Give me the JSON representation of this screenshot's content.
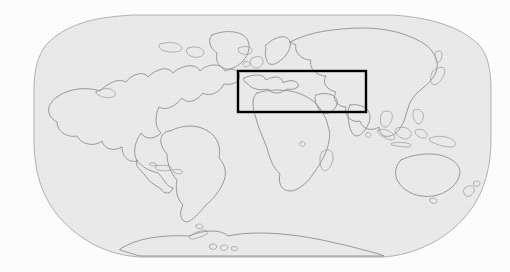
{
  "figure": {
    "kind": "world-map",
    "projection": "Robinson",
    "canvas": {
      "width": 510,
      "height": 272
    },
    "background_color": "#ffffff"
  },
  "map": {
    "ocean_fill_color": "#ececec",
    "ocean_border_color": "#b4b4b4",
    "coastline_color": "#8c8c8c",
    "bounds_px": {
      "left": 35,
      "top": 15,
      "right": 490,
      "bottom": 257
    },
    "graticule": "none",
    "labels": [],
    "tick_labels": []
  },
  "region_of_interest": {
    "name": "mediterranean-middle-east-study-area",
    "outline_color": "#000000",
    "outline_width_px": 2,
    "fill": "none",
    "box_px": {
      "x": 238,
      "y": 71,
      "width": 128,
      "height": 41
    },
    "label": ""
  },
  "landmasses": [
    {
      "name": "north-america"
    },
    {
      "name": "greenland"
    },
    {
      "name": "south-america"
    },
    {
      "name": "africa"
    },
    {
      "name": "europe"
    },
    {
      "name": "asia"
    },
    {
      "name": "australia"
    },
    {
      "name": "new-zealand"
    },
    {
      "name": "antarctica"
    },
    {
      "name": "madagascar"
    },
    {
      "name": "japan"
    },
    {
      "name": "british-isles"
    },
    {
      "name": "indonesia-philippines"
    }
  ],
  "chart_data": {
    "type": "map",
    "title": "",
    "xlabel": "",
    "ylabel": "",
    "legend": [],
    "annotations": [
      {
        "type": "rectangle",
        "label": "study region",
        "x_px": 238,
        "y_px": 71,
        "width_px": 128,
        "height_px": 41,
        "stroke": "#000000"
      }
    ]
  }
}
